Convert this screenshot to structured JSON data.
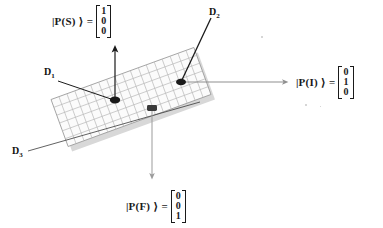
{
  "figure": {
    "background_color": "#ffffff",
    "slab": {
      "fill_color": "#fbfbfb",
      "grid_line_color": "#b4b4b4",
      "border_color": "#9a9a9a",
      "shadow_color": "#d6d6d6",
      "rotation_degrees": -20,
      "columns": 18,
      "rows": 6
    },
    "markers": [
      {
        "name": "detector-marker-d1",
        "color": "#1a1a1a"
      },
      {
        "name": "detector-marker-d2",
        "color": "#1a1a1a"
      },
      {
        "name": "detector-marker-center",
        "color": "#3a3a3a"
      }
    ]
  },
  "labels": {
    "d1": "D",
    "d1_sub": "1",
    "d2": "D",
    "d2_sub": "2",
    "d3": "D",
    "d3_sub": "3"
  },
  "kets": {
    "s": {
      "label": "|P(S) ⟩",
      "equals": "=",
      "vector": [
        "1",
        "0",
        "0"
      ]
    },
    "i": {
      "label": "|P(I) ⟩",
      "equals": "=",
      "vector": [
        "0",
        "1",
        "0"
      ]
    },
    "f": {
      "label": "|P(F) ⟩",
      "equals": "=",
      "vector": [
        "0",
        "0",
        "1"
      ]
    }
  },
  "arrows": {
    "up": {
      "name": "arrow-up-to-ps",
      "color": "#1a1a1a"
    },
    "right": {
      "name": "arrow-right-to-pi",
      "color": "#8f8f8f"
    },
    "down": {
      "name": "arrow-down-to-pf",
      "color": "#9b9b9b"
    },
    "leader_d1": {
      "name": "leader-line-d1",
      "color": "#1a1a1a"
    },
    "leader_d2": {
      "name": "leader-line-d2",
      "color": "#1a1a1a"
    },
    "leader_d3": {
      "name": "leader-line-d3",
      "color": "#3a3a3a"
    }
  }
}
